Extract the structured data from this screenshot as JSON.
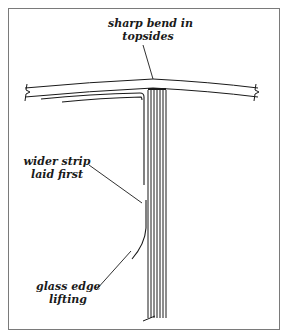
{
  "diagram": {
    "labels": {
      "top": [
        "sharp bend in",
        "topsides"
      ],
      "middle": [
        "wider strip",
        "laid first"
      ],
      "bottom": [
        "glass edge",
        "lifting"
      ]
    },
    "colors": {
      "ink": "#1a1a1a",
      "frame": "#7a7a7a",
      "background": "#ffffff"
    }
  }
}
